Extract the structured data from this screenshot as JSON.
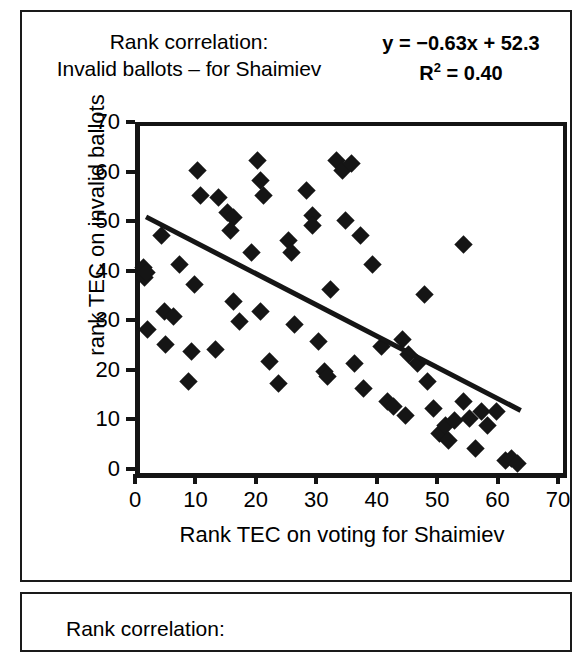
{
  "page": {
    "background_color": "#ffffff",
    "ink_color": "#151515"
  },
  "header": {
    "title_line1": "Rank correlation:",
    "title_line2": "Invalid ballots – for Shaimiev",
    "equation": "y = −0.63x + 52.3",
    "r_squared_prefix": "R",
    "r_squared_exponent": "2",
    "r_squared_value": "= 0.40"
  },
  "next_panel": {
    "caption": "Rank correlation:"
  },
  "chart_data": {
    "type": "scatter",
    "title": "Rank correlation: Invalid ballots – for Shaimiev",
    "xlabel": "Rank TEC on voting for Shaimiev",
    "ylabel": "rank TEC on invalid ballots",
    "xlim": [
      0,
      70
    ],
    "ylim": [
      0,
      70
    ],
    "xticks": [
      0,
      10,
      20,
      30,
      40,
      50,
      60,
      70
    ],
    "yticks": [
      0,
      10,
      20,
      30,
      40,
      50,
      60,
      70
    ],
    "grid": false,
    "legend": "none",
    "marker": "diamond",
    "marker_color": "#151515",
    "trendline": {
      "slope": -0.63,
      "intercept": 52.3,
      "r_squared": 0.4,
      "label": "y = −0.63x + 52.3",
      "x_start": 1,
      "x_end": 63,
      "color": "#151515",
      "width_px": 5
    },
    "points": [
      [
        0.5,
        41.5
      ],
      [
        0.7,
        39.5
      ],
      [
        1.0,
        40.5
      ],
      [
        1.2,
        29.0
      ],
      [
        3.5,
        48.0
      ],
      [
        4.0,
        32.5
      ],
      [
        4.3,
        26.0
      ],
      [
        5.5,
        31.5
      ],
      [
        6.5,
        42.0
      ],
      [
        8.0,
        18.5
      ],
      [
        8.5,
        24.5
      ],
      [
        9.5,
        61.0
      ],
      [
        9.0,
        38.0
      ],
      [
        10.0,
        56.0
      ],
      [
        12.5,
        25.0
      ],
      [
        13.0,
        55.5
      ],
      [
        14.5,
        52.5
      ],
      [
        15.5,
        51.5
      ],
      [
        15.0,
        49.0
      ],
      [
        15.5,
        34.5
      ],
      [
        16.5,
        30.5
      ],
      [
        18.5,
        44.5
      ],
      [
        19.5,
        63.0
      ],
      [
        20.0,
        59.0
      ],
      [
        20.5,
        56.0
      ],
      [
        20.0,
        32.5
      ],
      [
        21.5,
        22.5
      ],
      [
        23.0,
        18.0
      ],
      [
        24.5,
        47.0
      ],
      [
        25.0,
        44.5
      ],
      [
        25.5,
        30.0
      ],
      [
        27.5,
        57.0
      ],
      [
        28.5,
        52.0
      ],
      [
        28.5,
        50.0
      ],
      [
        29.5,
        26.5
      ],
      [
        30.5,
        20.5
      ],
      [
        31.0,
        19.5
      ],
      [
        31.5,
        37.0
      ],
      [
        32.5,
        63.0
      ],
      [
        33.5,
        61.0
      ],
      [
        34.0,
        51.0
      ],
      [
        35.0,
        62.5
      ],
      [
        35.5,
        22.0
      ],
      [
        36.5,
        48.0
      ],
      [
        37.0,
        17.0
      ],
      [
        38.5,
        42.0
      ],
      [
        40.0,
        25.5
      ],
      [
        41.0,
        14.5
      ],
      [
        42.0,
        13.5
      ],
      [
        43.5,
        27.0
      ],
      [
        44.5,
        24.0
      ],
      [
        44.0,
        11.5
      ],
      [
        46.0,
        22.0
      ],
      [
        47.0,
        36.0
      ],
      [
        47.5,
        18.5
      ],
      [
        48.5,
        13.0
      ],
      [
        49.5,
        8.0
      ],
      [
        50.5,
        9.5
      ],
      [
        51.0,
        6.5
      ],
      [
        52.0,
        10.5
      ],
      [
        53.5,
        46.0
      ],
      [
        53.5,
        14.5
      ],
      [
        54.5,
        11.0
      ],
      [
        55.5,
        5.0
      ],
      [
        56.5,
        12.5
      ],
      [
        57.5,
        9.5
      ],
      [
        59.0,
        12.5
      ],
      [
        60.5,
        2.5
      ],
      [
        61.5,
        3.0
      ],
      [
        62.5,
        2.0
      ]
    ]
  }
}
